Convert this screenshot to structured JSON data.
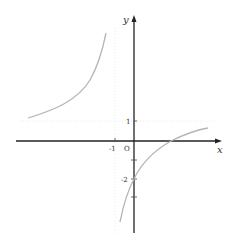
{
  "figure": {
    "type": "function-graph",
    "axes": {
      "x_label": "x",
      "y_label": "y",
      "origin_label": "O"
    },
    "tick_labels": {
      "x_neg_one": "-1",
      "y_one": "1",
      "y_neg_two": "-2"
    },
    "asymptotes": {
      "vertical": "x = -1",
      "horizontal": "y = 1"
    },
    "key_points": {
      "y_intercept": -2,
      "x_intercept": 2
    },
    "colors": {
      "axis": "#222222",
      "curve": "#b0b0b0",
      "asymptote": "#e6e6e6"
    }
  }
}
